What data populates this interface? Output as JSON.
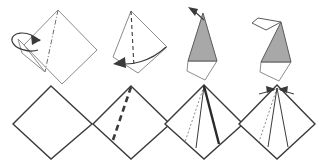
{
  "figure": {
    "background_color": "#ffffff",
    "width": 317,
    "height": 161,
    "stroke_color": "#3a3a3a",
    "stroke_color_light": "#8c8c8c",
    "shaded_fill": "#a8a8a8",
    "paper_fill": "#ffffff",
    "rows": 2,
    "columns": 4
  },
  "panels": [
    {
      "id": "panel-top-1",
      "row": "top",
      "index": 1,
      "label": "Kite base with valley fold marked, flap lifting left",
      "fill": "#ffffff",
      "outline": "58,10 97,50 62,84 24,45",
      "fold_line": {
        "style": "dash-dot",
        "from": "58,10",
        "to": "45,72"
      },
      "flap": {
        "style": "solid-light",
        "points": "24,45 18,39 22,53 45,72"
      },
      "arrow": {
        "type": "loop-arrow",
        "label": "fold-flap-left-arrow",
        "path": "M 40,41 C 26,28 10,33 12,41 C 14,49 30,53 38,50",
        "head": "31,35 41,40 32,45"
      }
    },
    {
      "id": "panel-top-2",
      "row": "top",
      "index": 2,
      "label": "Narrow kite with valley fold, swing flap left",
      "fill": "#ffffff",
      "outline": "131,11 167,47 138,73 113,57",
      "fold_line": {
        "style": "dashed",
        "from": "131,11",
        "to": "134,67"
      },
      "arrow": {
        "type": "sweep-arrow",
        "label": "swing-flap-left-arrow",
        "path": "M 166,47 C 150,62 130,66 116,63",
        "head": "125,57 113,64 126,68"
      }
    },
    {
      "id": "panel-top-3",
      "row": "top",
      "index": 3,
      "label": "Shaded triangle over white diamond, pull point up-left",
      "shaded": "203,13 217,61 188,61",
      "paper": "188,61 217,61 205,80 187,71",
      "outline_light": "188,61 187,71 205,80 217,61",
      "arrow": {
        "type": "straight-arrow",
        "label": "pull-point-up-left-arrow",
        "path": "M 204,20 L 192,9",
        "head": "188,7 198,9 195,16"
      }
    },
    {
      "id": "panel-top-4",
      "row": "top",
      "index": 4,
      "label": "Completed head shape with white beak flap",
      "shaded": "281,22 291,62 261,62",
      "paper": "261,62 291,62 279,81 260,72",
      "beak": "281,22 258,18 252,23 266,30",
      "outline_light": "261,62 260,72 279,81 291,62"
    },
    {
      "id": "panel-bottom-1",
      "row": "bottom",
      "index": 1,
      "label": "Plain square, rotated 45 degrees",
      "fill": "#ffffff",
      "outline": "51,86 92,124 51,159 13,124"
    },
    {
      "id": "panel-bottom-2",
      "row": "bottom",
      "index": 2,
      "label": "Square with bold valley fold crease down-left",
      "fill": "#ffffff",
      "outline": "131,86 170,124 131,159 93,124",
      "crease": {
        "style": "bold-dashed",
        "from": "131,87",
        "to": "112,143"
      }
    },
    {
      "id": "panel-bottom-3",
      "row": "bottom",
      "index": 3,
      "label": "Square with dotted crease left and bold fold right",
      "fill": "#ffffff",
      "outline": "204,85 243,124 204,159 165,124",
      "crease_dotted": {
        "style": "dotted",
        "from": "204,86",
        "to": "185,142"
      },
      "crease_bold": {
        "style": "bold-solid",
        "from": "204,86",
        "to": "219,144"
      },
      "fold_edge": {
        "style": "thin-solid",
        "from": "204,86",
        "to": "196,148"
      }
    },
    {
      "id": "panel-bottom-4",
      "row": "bottom",
      "index": 4,
      "label": "Square with converging arrows at apex, petal fold",
      "fill": "#ffffff",
      "outline": "277,85 315,124 277,159 239,124",
      "crease_dotted": {
        "style": "dotted",
        "from": "277,88",
        "to": "259,142"
      },
      "fold_edge_left": {
        "style": "thin-solid",
        "from": "277,88",
        "to": "268,147"
      },
      "fold_edge_right": {
        "style": "thin-solid",
        "from": "277,88",
        "to": "288,147"
      },
      "arrow_left": {
        "type": "short-arrow",
        "label": "petal-fold-left-arrow",
        "path": "M 259,94 L 274,90",
        "head": "276,89 266,86 267,93"
      },
      "arrow_right": {
        "type": "short-arrow",
        "label": "petal-fold-right-arrow",
        "path": "M 294,94 L 280,90",
        "head": "278,89 288,86 287,93"
      }
    }
  ]
}
